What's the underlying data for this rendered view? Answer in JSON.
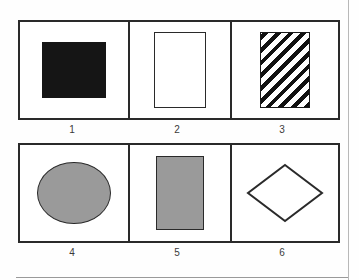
{
  "figure": {
    "background_color": "#fefefe",
    "frame_color": "#2a2a2a",
    "rows": [
      {
        "id": "row-top",
        "cells": [
          {
            "label": "1",
            "shape": "filled-square",
            "fill": "#151515",
            "outline": "#151515",
            "pattern": "solid"
          },
          {
            "label": "2",
            "shape": "rectangle",
            "fill": "#ffffff",
            "outline": "#2a2a2a",
            "pattern": "none"
          },
          {
            "label": "3",
            "shape": "rectangle",
            "fill": "#ffffff",
            "outline": "#1a1a1a",
            "pattern": "diagonal-hatch"
          }
        ]
      },
      {
        "id": "row-bottom",
        "cells": [
          {
            "label": "4",
            "shape": "ellipse",
            "fill": "#9a9a9a",
            "outline": "#2a2a2a",
            "pattern": "solid"
          },
          {
            "label": "5",
            "shape": "rectangle",
            "fill": "#9a9a9a",
            "outline": "#2a2a2a",
            "pattern": "solid"
          },
          {
            "label": "6",
            "shape": "diamond",
            "fill": "#ffffff",
            "outline": "#2a2a2a",
            "pattern": "none"
          }
        ]
      }
    ]
  }
}
